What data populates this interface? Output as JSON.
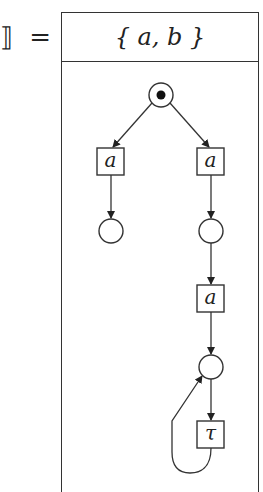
{
  "equation": {
    "lhs_fragment": "⟧ =",
    "alphabet_label": "{ a, b }"
  },
  "petri_net": {
    "places": [
      {
        "id": "p0",
        "cx": 161,
        "cy": 95,
        "r": 12,
        "marked": true
      },
      {
        "id": "p1",
        "cx": 111,
        "cy": 231,
        "r": 12,
        "marked": false
      },
      {
        "id": "p2",
        "cx": 211,
        "cy": 231,
        "r": 12,
        "marked": false
      },
      {
        "id": "p3",
        "cx": 211,
        "cy": 367,
        "r": 12,
        "marked": false
      }
    ],
    "transitions": [
      {
        "id": "t1",
        "label": "a",
        "x": 97,
        "y": 148,
        "w": 27,
        "h": 27
      },
      {
        "id": "t2",
        "label": "a",
        "x": 197,
        "y": 148,
        "w": 27,
        "h": 27
      },
      {
        "id": "t3",
        "label": "a",
        "x": 197,
        "y": 285,
        "w": 27,
        "h": 27
      },
      {
        "id": "t4",
        "label": "τ",
        "x": 197,
        "y": 421,
        "w": 27,
        "h": 27
      }
    ],
    "arcs": [
      {
        "from": "p0",
        "to": "t1"
      },
      {
        "from": "p0",
        "to": "t2"
      },
      {
        "from": "t1",
        "to": "p1"
      },
      {
        "from": "t2",
        "to": "p2"
      },
      {
        "from": "p2",
        "to": "t3"
      },
      {
        "from": "t3",
        "to": "p3"
      },
      {
        "from": "p3",
        "to": "t4"
      },
      {
        "from": "t4",
        "to": "p3",
        "curved": true
      }
    ]
  }
}
